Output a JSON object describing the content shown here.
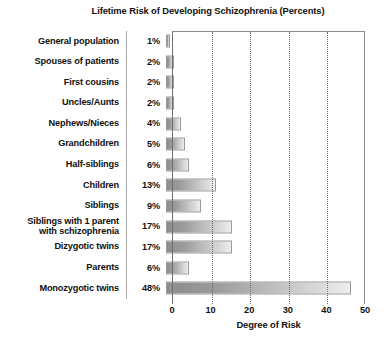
{
  "chart_data": {
    "type": "bar",
    "orientation": "horizontal",
    "title": "Lifetime Risk of Developing Schizophrenia (Percents)",
    "xlabel": "Degree of Risk",
    "ylabel": "",
    "xlim": [
      0,
      50
    ],
    "xticks": [
      0,
      10,
      20,
      30,
      40,
      50
    ],
    "xtick_labels": [
      "0",
      "10",
      "20",
      "30",
      "40",
      "50"
    ],
    "grid": "vertical-dotted",
    "legend": null,
    "categories": [
      "General population",
      "Spouses of patients",
      "First cousins",
      "Uncles/Aunts",
      "Nephews/Nieces",
      "Grandchildren",
      "Half-siblings",
      "Children",
      "Siblings",
      "Siblings with 1 parent with schizophrenia",
      "Dizygotic twins",
      "Parents",
      "Monozygotic twins"
    ],
    "values": [
      1,
      2,
      2,
      2,
      4,
      5,
      6,
      13,
      9,
      17,
      17,
      6,
      48
    ],
    "value_labels": [
      "1%",
      "2%",
      "2%",
      "2%",
      "4%",
      "5%",
      "6%",
      "13%",
      "9%",
      "17%",
      "17%",
      "6%",
      "48%"
    ],
    "bar_gradient": {
      "start": "#8d8d8d",
      "end": "#ededed"
    },
    "bar_border": "#9a9a9a"
  },
  "rows": [
    {
      "label_line1": "General population",
      "label_line2": "",
      "pct": "1%",
      "value": 1
    },
    {
      "label_line1": "Spouses of patients",
      "label_line2": "",
      "pct": "2%",
      "value": 2
    },
    {
      "label_line1": "First cousins",
      "label_line2": "",
      "pct": "2%",
      "value": 2
    },
    {
      "label_line1": "Uncles/Aunts",
      "label_line2": "",
      "pct": "2%",
      "value": 2
    },
    {
      "label_line1": "Nephews/Nieces",
      "label_line2": "",
      "pct": "4%",
      "value": 4
    },
    {
      "label_line1": "Grandchildren",
      "label_line2": "",
      "pct": "5%",
      "value": 5
    },
    {
      "label_line1": "Half-siblings",
      "label_line2": "",
      "pct": "6%",
      "value": 6
    },
    {
      "label_line1": "Children",
      "label_line2": "",
      "pct": "13%",
      "value": 13
    },
    {
      "label_line1": "Siblings",
      "label_line2": "",
      "pct": "9%",
      "value": 9
    },
    {
      "label_line1": "Siblings with 1 parent",
      "label_line2": "with schizophrenia",
      "pct": "17%",
      "value": 17
    },
    {
      "label_line1": "Dizygotic twins",
      "label_line2": "",
      "pct": "17%",
      "value": 17
    },
    {
      "label_line1": "Parents",
      "label_line2": "",
      "pct": "6%",
      "value": 6
    },
    {
      "label_line1": "Monozygotic twins",
      "label_line2": "",
      "pct": "48%",
      "value": 48
    }
  ]
}
